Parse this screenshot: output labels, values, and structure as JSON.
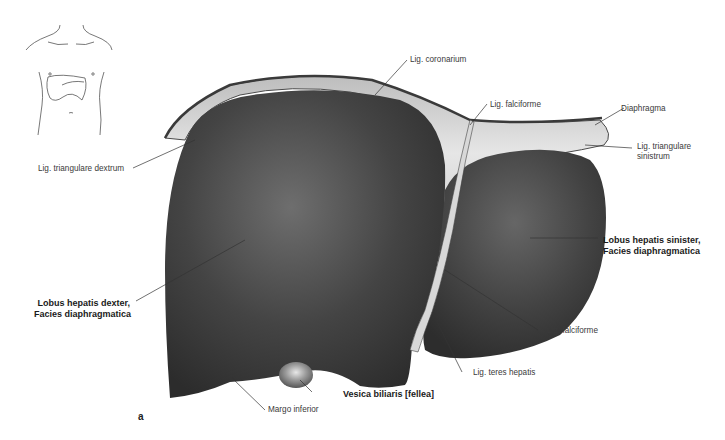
{
  "figure": {
    "panel_letter": "a",
    "orientation_sketch": "torso-outline-with-liver-icon",
    "colors": {
      "liver": "#3c3c3c",
      "liver_highlight": "#6a6a6a",
      "ligament": "#d9d9d9",
      "diaphragm_edge": "#5a5a5a",
      "leader_line": "#333333",
      "gallbladder": "#8a8a8a"
    }
  },
  "labels": {
    "lig_coronarium": "Lig. coronarium",
    "lig_falciforme_top": "Lig. falciforme",
    "diaphragma": "Diaphragma",
    "lig_triangulare_sinistrum_1": "Lig. triangulare",
    "lig_triangulare_sinistrum_2": "sinistrum",
    "lig_triangulare_dextrum": "Lig. triangulare dextrum",
    "lobus_sinister_1": "Lobus hepatis sinister,",
    "lobus_sinister_2": "Facies diaphragmatica",
    "lobus_dexter_1": "Lobus hepatis dexter,",
    "lobus_dexter_2": "Facies diaphragmatica",
    "lig_falciforme_bottom": "Lig. falciforme",
    "lig_teres_hepatis": "Lig. teres hepatis",
    "vesica_biliaris": "Vesica biliaris [fellea]",
    "margo_inferior": "Margo inferior"
  }
}
